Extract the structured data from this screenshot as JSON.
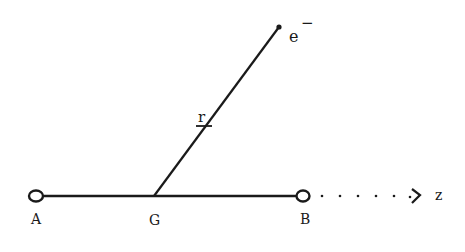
{
  "diagram": {
    "colors": {
      "ink": "#1a1a1a",
      "background": "#ffffff"
    },
    "labels": {
      "a": "A",
      "g": "G",
      "b": "B",
      "z": "z",
      "r": "r",
      "electron": "e",
      "electron_charge": "−"
    },
    "nodes": [
      {
        "id": "A",
        "shape": "open-circle"
      },
      {
        "id": "G",
        "shape": "junction"
      },
      {
        "id": "B",
        "shape": "open-circle"
      },
      {
        "id": "e-",
        "shape": "dot"
      }
    ],
    "edges": [
      {
        "from": "A",
        "to": "B",
        "style": "solid",
        "label": ""
      },
      {
        "from": "G",
        "to": "e-",
        "style": "solid",
        "label": "r"
      },
      {
        "from": "B",
        "to": "z",
        "style": "dotted-arrow",
        "label": "z"
      }
    ]
  }
}
